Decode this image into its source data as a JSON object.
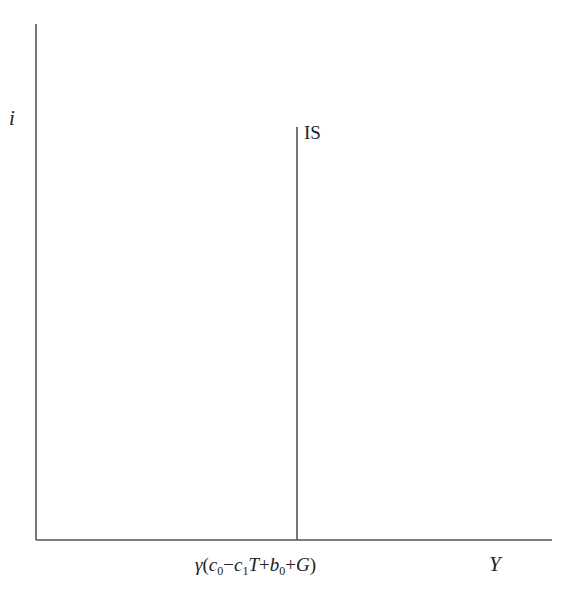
{
  "diagram": {
    "type": "IS curve (vertical) in i–Y space",
    "axes": {
      "y_label": "i",
      "x_label": "Y"
    },
    "curves": [
      {
        "name": "IS",
        "label": "IS",
        "orientation": "vertical"
      }
    ],
    "x_tick_label": {
      "gamma": "γ",
      "open": "(",
      "c": "c",
      "c_sub": "0",
      "minus": "−",
      "c1": "c",
      "c1_sub": "1",
      "T": "T",
      "plus1": "+",
      "b": "b",
      "b_sub": "0",
      "plus2": "+",
      "G": "G",
      "close": ")",
      "full_text": "γ(c0 − c1T + b0 + G)"
    },
    "colors": {
      "line": "#555555",
      "text": "#222222",
      "background": "#ffffff"
    }
  }
}
